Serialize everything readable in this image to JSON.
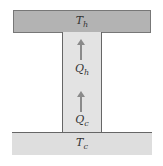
{
  "hot_reservoir": {
    "label": "T",
    "sub": "h"
  },
  "cold_reservoir": {
    "label": "T",
    "sub": "c"
  },
  "flows": [
    {
      "label": "Q",
      "sub": "h",
      "direction": "up"
    },
    {
      "label": "Q",
      "sub": "c",
      "direction": "up"
    }
  ],
  "colors": {
    "hot": "#b3b3b3",
    "cold": "#dedede",
    "column": "#e3e3e3",
    "arrow": "#8a8a8a"
  }
}
